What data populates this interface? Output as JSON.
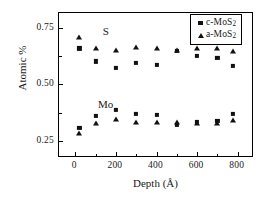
{
  "chart_data": {
    "type": "scatter",
    "title": "",
    "xlabel": "Depth (Å)",
    "ylabel": "Atomic %",
    "xlim": [
      -80,
      880
    ],
    "ylim": [
      0.175,
      0.815
    ],
    "xticks": [
      0,
      200,
      400,
      600,
      800
    ],
    "xtick_labels": [
      "0",
      "200",
      "400",
      "600",
      "800"
    ],
    "x_minor_ticks": [
      100,
      300,
      500,
      700
    ],
    "yticks": [
      0.25,
      0.5,
      0.75
    ],
    "ytick_labels": [
      "0.25",
      "0.50",
      "0.75"
    ],
    "y_minor_ticks": [
      0.375,
      0.625
    ],
    "grid": false,
    "legend_position": "top-right",
    "annotations": [
      {
        "text": "S",
        "x": 150,
        "y": 0.735
      },
      {
        "text": "Mo",
        "x": 150,
        "y": 0.415
      }
    ],
    "series": [
      {
        "name": "c-MoS",
        "name_sub": "2",
        "label": "c-MoS₂",
        "marker": "square",
        "color": "#111111",
        "groups": [
          {
            "element": "S",
            "points": [
              {
                "x": 20,
                "y": 0.659
              },
              {
                "x": 100,
                "y": 0.601
              },
              {
                "x": 200,
                "y": 0.571
              },
              {
                "x": 300,
                "y": 0.596
              },
              {
                "x": 400,
                "y": 0.585
              },
              {
                "x": 500,
                "y": 0.648
              },
              {
                "x": 600,
                "y": 0.627
              },
              {
                "x": 700,
                "y": 0.616
              },
              {
                "x": 775,
                "y": 0.58
              }
            ]
          },
          {
            "element": "Mo",
            "points": [
              {
                "x": 20,
                "y": 0.308
              },
              {
                "x": 100,
                "y": 0.362
              },
              {
                "x": 200,
                "y": 0.386
              },
              {
                "x": 300,
                "y": 0.368
              },
              {
                "x": 400,
                "y": 0.365
              },
              {
                "x": 500,
                "y": 0.321
              },
              {
                "x": 600,
                "y": 0.335
              },
              {
                "x": 700,
                "y": 0.337
              },
              {
                "x": 775,
                "y": 0.368
              }
            ]
          }
        ]
      },
      {
        "name": "a-MoS",
        "name_sub": "2",
        "label": "a-MoS₂",
        "marker": "triangle",
        "color": "#111111",
        "groups": [
          {
            "element": "S",
            "points": [
              {
                "x": 20,
                "y": 0.712
              },
              {
                "x": 100,
                "y": 0.666
              },
              {
                "x": 200,
                "y": 0.654
              },
              {
                "x": 300,
                "y": 0.668
              },
              {
                "x": 400,
                "y": 0.667
              },
              {
                "x": 500,
                "y": 0.657
              },
              {
                "x": 600,
                "y": 0.667
              },
              {
                "x": 700,
                "y": 0.665
              },
              {
                "x": 775,
                "y": 0.652
              }
            ]
          },
          {
            "element": "Mo",
            "points": [
              {
                "x": 20,
                "y": 0.291
              },
              {
                "x": 100,
                "y": 0.336
              },
              {
                "x": 200,
                "y": 0.35
              },
              {
                "x": 300,
                "y": 0.34
              },
              {
                "x": 400,
                "y": 0.337
              },
              {
                "x": 500,
                "y": 0.34
              },
              {
                "x": 600,
                "y": 0.334
              },
              {
                "x": 700,
                "y": 0.335
              },
              {
                "x": 775,
                "y": 0.349
              }
            ]
          }
        ]
      }
    ]
  }
}
